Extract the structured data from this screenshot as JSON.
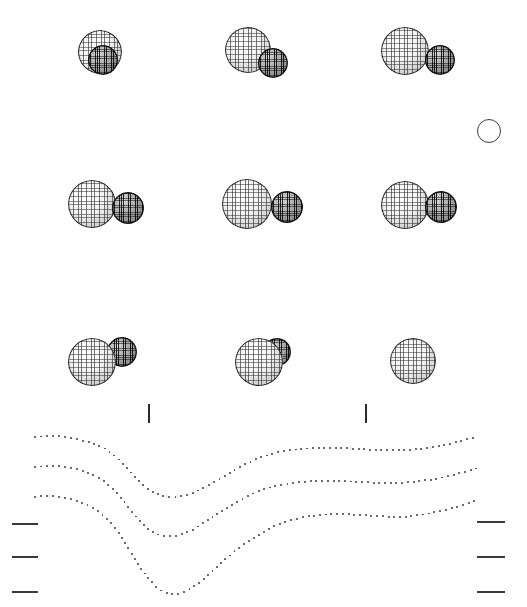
{
  "figure": {
    "title": "",
    "background": "#ffffff",
    "width": 527,
    "height": 607,
    "colors": {
      "primary_sphere": "#efefef",
      "secondary_sphere": "#3a3a3a",
      "outline": "#2b2b2b",
      "dot": "#3c3c3c",
      "tick": "#3a3a3a"
    }
  },
  "reference_circle": {
    "label": "reference-circle",
    "cx": 488,
    "cy": 130,
    "r": 11
  },
  "phase_ticks": [
    {
      "label": "tick-left",
      "x": 148,
      "y": 404,
      "height": 19
    },
    {
      "label": "tick-right",
      "x": 365,
      "y": 404,
      "height": 19
    }
  ],
  "axis_ticks_left": [
    {
      "label": "level-1",
      "x": 12,
      "y": 523,
      "width": 26
    },
    {
      "label": "level-2",
      "x": 12,
      "y": 556,
      "width": 26
    },
    {
      "label": "level-3",
      "x": 12,
      "y": 591,
      "width": 26
    }
  ],
  "axis_ticks_right": [
    {
      "label": "level-1",
      "x": 477,
      "y": 521,
      "width": 28
    },
    {
      "label": "level-2",
      "x": 477,
      "y": 556,
      "width": 28
    },
    {
      "label": "level-3",
      "x": 477,
      "y": 591,
      "width": 28
    }
  ],
  "sphere_grid": {
    "rows": 3,
    "cols": 3,
    "items": [
      {
        "name": "config-r1c1",
        "row": 1,
        "col": 1,
        "primary": {
          "cx": 100,
          "cy": 52,
          "r": 22
        },
        "secondary": {
          "cx": 103,
          "cy": 60,
          "r": 15,
          "in_front": true
        }
      },
      {
        "name": "config-r1c2",
        "row": 1,
        "col": 2,
        "primary": {
          "cx": 248,
          "cy": 50,
          "r": 23
        },
        "secondary": {
          "cx": 273,
          "cy": 63,
          "r": 15,
          "in_front": true
        }
      },
      {
        "name": "config-r1c3",
        "row": 1,
        "col": 3,
        "primary": {
          "cx": 405,
          "cy": 51,
          "r": 24
        },
        "secondary": {
          "cx": 440,
          "cy": 60,
          "r": 15,
          "in_front": true
        }
      },
      {
        "name": "config-r2c1",
        "row": 2,
        "col": 1,
        "primary": {
          "cx": 92,
          "cy": 204,
          "r": 24
        },
        "secondary": {
          "cx": 128,
          "cy": 208,
          "r": 16,
          "in_front": true
        }
      },
      {
        "name": "config-r2c2",
        "row": 2,
        "col": 2,
        "primary": {
          "cx": 247,
          "cy": 204,
          "r": 25
        },
        "secondary": {
          "cx": 287,
          "cy": 207,
          "r": 16,
          "in_front": true
        }
      },
      {
        "name": "config-r2c3",
        "row": 2,
        "col": 3,
        "primary": {
          "cx": 405,
          "cy": 205,
          "r": 24
        },
        "secondary": {
          "cx": 441,
          "cy": 207,
          "r": 16,
          "in_front": true
        }
      },
      {
        "name": "config-r3c1",
        "row": 3,
        "col": 1,
        "primary": {
          "cx": 92,
          "cy": 362,
          "r": 24
        },
        "secondary": {
          "cx": 122,
          "cy": 352,
          "r": 15,
          "in_front": false
        }
      },
      {
        "name": "config-r3c2",
        "row": 3,
        "col": 2,
        "primary": {
          "cx": 259,
          "cy": 362,
          "r": 24
        },
        "secondary": {
          "cx": 277,
          "cy": 352,
          "r": 14,
          "in_front": false
        }
      },
      {
        "name": "config-r3c3",
        "row": 3,
        "col": 3,
        "primary": {
          "cx": 413,
          "cy": 361,
          "r": 23
        },
        "secondary": {
          "cx": 413,
          "cy": 358,
          "r": 13,
          "in_front": false
        }
      }
    ]
  },
  "chart_data": {
    "type": "line",
    "title": "",
    "xlabel": "",
    "ylabel": "",
    "grid": false,
    "legend": "none",
    "style": "dotted",
    "xlim": [
      0,
      527
    ],
    "ylim": [
      607,
      430
    ],
    "series": [
      {
        "name": "curve-top",
        "x": [
          35,
          50,
          65,
          80,
          95,
          110,
          125,
          140,
          150,
          160,
          175,
          190,
          205,
          220,
          235,
          250,
          265,
          280,
          300,
          320,
          340,
          360,
          380,
          400,
          420,
          440,
          460,
          478
        ],
        "y": [
          437,
          436,
          437,
          440,
          444,
          452,
          466,
          482,
          490,
          495,
          497,
          494,
          487,
          479,
          470,
          462,
          456,
          452,
          449,
          448,
          448,
          449,
          450,
          450,
          449,
          446,
          441,
          437
        ]
      },
      {
        "name": "curve-middle",
        "x": [
          35,
          50,
          65,
          80,
          95,
          110,
          125,
          140,
          150,
          160,
          175,
          190,
          205,
          220,
          235,
          250,
          265,
          280,
          300,
          320,
          340,
          360,
          380,
          400,
          420,
          440,
          460,
          478
        ],
        "y": [
          467,
          466,
          467,
          470,
          476,
          486,
          503,
          521,
          530,
          535,
          536,
          531,
          522,
          512,
          503,
          495,
          489,
          485,
          482,
          481,
          481,
          482,
          483,
          483,
          481,
          478,
          473,
          468
        ]
      },
      {
        "name": "curve-bottom",
        "x": [
          35,
          50,
          65,
          80,
          95,
          110,
          125,
          140,
          150,
          160,
          175,
          190,
          205,
          220,
          235,
          250,
          265,
          280,
          300,
          320,
          340,
          360,
          380,
          400,
          420,
          440,
          460,
          478
        ],
        "y": [
          497,
          496,
          498,
          502,
          509,
          522,
          543,
          567,
          580,
          590,
          594,
          589,
          578,
          564,
          551,
          540,
          531,
          524,
          518,
          515,
          514,
          515,
          516,
          517,
          515,
          511,
          506,
          500
        ]
      }
    ]
  }
}
